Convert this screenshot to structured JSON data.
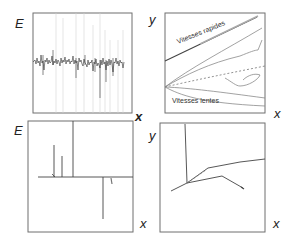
{
  "panels": [
    {
      "id": "top-left",
      "y_axis_label": "E",
      "x_axis_label": "x",
      "description": "noisy energy signal"
    },
    {
      "id": "top-right",
      "y_axis_label": "y",
      "x_axis_label": "x",
      "annotations": {
        "fast": "Vitesses rapides",
        "slow": "Vitesses lentes"
      }
    },
    {
      "id": "bottom-left",
      "y_axis_label": "E",
      "x_axis_label": "x",
      "description": "discrete spikes"
    },
    {
      "id": "bottom-right",
      "y_axis_label": "y",
      "x_axis_label": "x",
      "description": "trajectory branches"
    }
  ],
  "colors": {
    "frame": "#6f6f6f",
    "curve": "#8a8a8a",
    "dark_curve": "#444444",
    "text": "#222222"
  }
}
